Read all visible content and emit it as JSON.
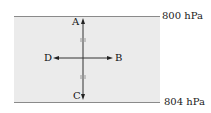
{
  "diagram": {
    "isobars": [
      {
        "label": "800 hPa",
        "position": "top"
      },
      {
        "label": "804 hPa",
        "position": "bottom"
      }
    ],
    "points": {
      "A": "A",
      "B": "B",
      "C": "C",
      "D": "D"
    },
    "colors": {
      "band": "#ebebeb",
      "lines": "#8a8a8a",
      "arrows": "#222222"
    }
  }
}
